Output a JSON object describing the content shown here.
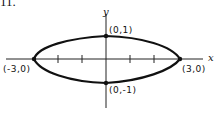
{
  "figure": {
    "problem_number": "11.",
    "equation_implied": "x^2/9 + y^2 = 1",
    "axes": {
      "x_label": "x",
      "y_label": "y"
    },
    "points": [
      {
        "label": "(0,1)",
        "x": 0,
        "y": 1,
        "position": "top"
      },
      {
        "label": "(0,-1)",
        "x": 0,
        "y": -1,
        "position": "bottom"
      },
      {
        "label": "(-3,0)",
        "x": -3,
        "y": 0,
        "position": "left"
      },
      {
        "label": "(3,0)",
        "x": 3,
        "y": 0,
        "position": "right"
      }
    ],
    "x_ticks": [
      -2,
      -1,
      1,
      2
    ],
    "colors": {
      "stroke": "#111111",
      "background": "#ffffff"
    }
  }
}
